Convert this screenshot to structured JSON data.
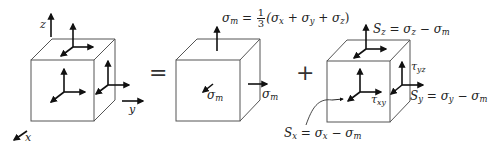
{
  "diagram": {
    "type": "stress-decomposition",
    "colors": {
      "edge": "#555555",
      "arrow": "#111111",
      "text": "#222222"
    },
    "axes": {
      "x_label": "x",
      "y_label": "y",
      "z_label": "z"
    },
    "operators": {
      "equals": "=",
      "plus": "+"
    },
    "cube_mean": {
      "formula_lhs": "σ",
      "formula_lhs_sub": "m",
      "formula_eq": " = ",
      "frac_num": "1",
      "frac_den": "3",
      "formula_rhs_open": "(σ",
      "rhs_sub_x": "x",
      "rhs_plus1": " + σ",
      "rhs_sub_y": "y",
      "rhs_plus2": " + σ",
      "rhs_sub_z": "z",
      "rhs_close": ")",
      "right_label": "σ",
      "right_label_sub": "m",
      "front_label": "σ",
      "front_label_sub": "m"
    },
    "cube_deviatoric": {
      "sz_lhs": "S",
      "sz_lhs_sub": "z",
      "sz_rhs": " = σ",
      "sz_rhs_sub": "z",
      "sz_minus": " − σ",
      "sz_minus_sub": "m",
      "sy_lhs": "S",
      "sy_lhs_sub": "y",
      "sy_rhs": " = σ",
      "sy_rhs_sub": "y",
      "sy_minus": " − σ",
      "sy_minus_sub": "m",
      "sx_lhs": "S",
      "sx_lhs_sub": "x",
      "sx_rhs": " = σ",
      "sx_rhs_sub": "x",
      "sx_minus": " − σ",
      "sx_minus_sub": "m",
      "tau_yz": "τ",
      "tau_yz_sub": "yz",
      "tau_xy": "τ",
      "tau_xy_sub": "xy"
    }
  }
}
